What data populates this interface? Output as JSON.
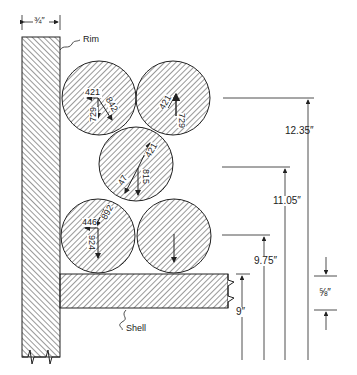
{
  "labels": {
    "rim": "Rim",
    "shell": "Shell",
    "rim_width": "¾″"
  },
  "dimensions": {
    "d1": "12.35″",
    "d2": "11.05″",
    "d3": "9.75″",
    "d4": "9″",
    "shell_thickness": "⅝″"
  },
  "forces": {
    "top_left": {
      "horizontal": "421",
      "vertical": "729",
      "diagonal": "842"
    },
    "top_right": {
      "diagonal": "421",
      "vertical": "729"
    },
    "middle": {
      "upper_diagonal": "421",
      "lower_diagonal": "47",
      "vertical": "815"
    },
    "bottom_left": {
      "diagonal": "892",
      "horizontal": "446",
      "vertical": "924"
    }
  },
  "colors": {
    "line": "#222222",
    "background": "#ffffff"
  }
}
